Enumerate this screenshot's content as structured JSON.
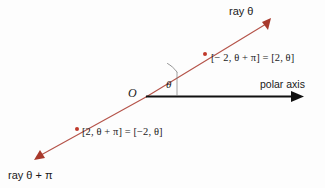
{
  "figure": {
    "background_color": "#fdfdfd",
    "ray_color": "#b5544a",
    "axis_color": "#111111",
    "point_color": "#c0392b",
    "labels": {
      "ray_theta": "ray θ",
      "ray_theta_plus_pi": "ray θ + π",
      "polar_axis": "polar axis",
      "origin": "O",
      "angle": "θ",
      "equation_upper": "[− 2, θ + π] = [2, θ]",
      "equation_lower": "[2, θ + π] = [−2, θ]"
    },
    "geometry": {
      "origin": {
        "x": 146,
        "y": 97
      },
      "ray_theta_tip": {
        "x": 270,
        "y": 20
      },
      "ray_theta_pi_tip": {
        "x": 36,
        "y": 158
      },
      "polar_axis_tip": {
        "x": 303,
        "y": 96
      },
      "point_upper": {
        "x": 205,
        "y": 54
      },
      "point_lower": {
        "x": 77,
        "y": 129
      },
      "angle_degrees": 32
    }
  }
}
